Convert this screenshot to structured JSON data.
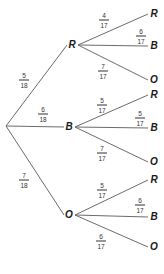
{
  "tree": {
    "root": {
      "x": 6,
      "y": 126
    },
    "first_level": [
      {
        "label": "R",
        "num": "5",
        "den": "18",
        "x": 72,
        "y": 45,
        "lx": 24,
        "ly": 80,
        "children": [
          {
            "label": "R",
            "num": "4",
            "den": "17",
            "x": 154,
            "y": 14,
            "lx": 104,
            "ly": 20
          },
          {
            "label": "B",
            "num": "6",
            "den": "17",
            "x": 154,
            "y": 46,
            "lx": 141,
            "ly": 36
          },
          {
            "label": "O",
            "num": "7",
            "den": "17",
            "x": 154,
            "y": 80,
            "lx": 103,
            "ly": 71
          }
        ]
      },
      {
        "label": "B",
        "num": "6",
        "den": "18",
        "x": 69,
        "y": 127,
        "lx": 43,
        "ly": 114,
        "children": [
          {
            "label": "R",
            "num": "5",
            "den": "17",
            "x": 154,
            "y": 95,
            "lx": 102,
            "ly": 105
          },
          {
            "label": "B",
            "num": "5",
            "den": "17",
            "x": 154,
            "y": 128,
            "lx": 140,
            "ly": 118
          },
          {
            "label": "O",
            "num": "7",
            "den": "17",
            "x": 154,
            "y": 162,
            "lx": 102,
            "ly": 153
          }
        ]
      },
      {
        "label": "O",
        "num": "7",
        "den": "18",
        "x": 69,
        "y": 215,
        "lx": 24,
        "ly": 180,
        "children": [
          {
            "label": "R",
            "num": "5",
            "den": "17",
            "x": 154,
            "y": 180,
            "lx": 102,
            "ly": 190
          },
          {
            "label": "B",
            "num": "6",
            "den": "17",
            "x": 154,
            "y": 217,
            "lx": 140,
            "ly": 205
          },
          {
            "label": "O",
            "num": "6",
            "den": "17",
            "x": 154,
            "y": 247,
            "lx": 101,
            "ly": 241
          }
        ]
      }
    ]
  },
  "colors": {
    "line": "#6b6b6b",
    "text": "#1a1a1a"
  }
}
